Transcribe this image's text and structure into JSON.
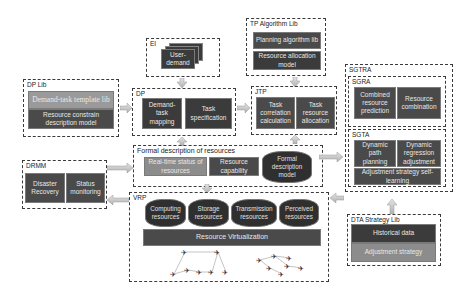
{
  "groups": {
    "ei": {
      "label": "EI",
      "user_demand": "User-\ndemand"
    },
    "dp_lib": {
      "label": "DP Lib",
      "items": [
        "Demand-task template lib",
        "Resource constrain description model"
      ]
    },
    "dp": {
      "label": "DP",
      "items": [
        "Demand-task mapping",
        "Task specification"
      ]
    },
    "tp_algorithm_lib": {
      "label": "TP Algorithm Lib",
      "items": [
        "Planning algorithm lib",
        "Resource allocation model"
      ]
    },
    "jtp": {
      "label": "JTP",
      "items": [
        "Task correlation calculation",
        "Task resource allocation"
      ]
    },
    "sgtra": {
      "label": "SGTRA"
    },
    "sgra": {
      "label": "SGRA",
      "items": [
        "Combined resource prediction",
        "Resource combination"
      ]
    },
    "sgta": {
      "label": "SGTA",
      "items": [
        "Dynamic path planning",
        "Dynamic regression adjustment",
        "Adjustment strategy self-learning"
      ]
    },
    "formal": {
      "label": "Formal description of resources",
      "items": [
        "Real-time status of resources",
        "Resource capability",
        "Formal description model"
      ]
    },
    "drmm": {
      "label": "DRMM",
      "items": [
        "Disaster Recovery",
        "Status monitoring"
      ]
    },
    "vrp": {
      "label": "VRP",
      "resources": [
        "Computing resources",
        "Storage resources",
        "Transmission resources",
        "Perceived resources"
      ],
      "virtualization": "Resource Virtualization"
    },
    "dta_lib": {
      "label": "DTA Strategy Lib",
      "items": [
        "Historical data",
        "Adjustment strategy"
      ]
    }
  },
  "colors": {
    "dark_box": "#3b3b3b",
    "light_box": "#8c8c8c",
    "arrow_fill": "#c8c8c8",
    "dashed_border": "#3a3a3a"
  }
}
